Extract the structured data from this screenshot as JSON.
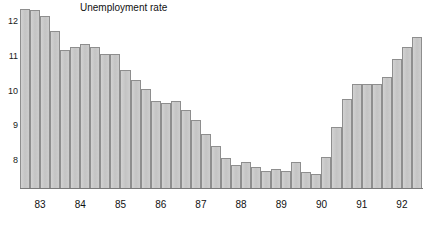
{
  "chart_data": {
    "type": "bar",
    "title": "Unemployment rate",
    "xlabel": "",
    "ylabel": "",
    "ylim": [
      7.2,
      12.6
    ],
    "yticks": [
      8,
      9,
      10,
      11,
      12
    ],
    "ytick_labels": [
      "8",
      "9",
      "10",
      "11",
      "12"
    ],
    "grid": false,
    "legend": "none",
    "categories": [
      "83 Q1",
      "83 Q2",
      "83 Q3",
      "83 Q4",
      "84 Q1",
      "84 Q2",
      "84 Q3",
      "84 Q4",
      "85 Q1",
      "85 Q2",
      "85 Q3",
      "85 Q4",
      "86 Q1",
      "86 Q2",
      "86 Q3",
      "86 Q4",
      "87 Q1",
      "87 Q2",
      "87 Q3",
      "87 Q4",
      "88 Q1",
      "88 Q2",
      "88 Q3",
      "88 Q4",
      "89 Q1",
      "89 Q2",
      "89 Q3",
      "89 Q4",
      "90 Q1",
      "90 Q2",
      "90 Q3",
      "90 Q4",
      "91 Q1",
      "91 Q2",
      "91 Q3",
      "91 Q4",
      "92 Q1",
      "92 Q2",
      "92 Q3",
      "92 Q4"
    ],
    "values": [
      12.35,
      12.3,
      12.15,
      11.7,
      11.15,
      11.25,
      11.35,
      11.25,
      11.05,
      11.05,
      10.6,
      10.3,
      10.05,
      9.7,
      9.65,
      9.7,
      9.45,
      9.15,
      8.75,
      8.4,
      8.05,
      7.85,
      7.95,
      7.8,
      7.7,
      7.75,
      7.7,
      7.95,
      7.65,
      7.6,
      8.1,
      8.95,
      9.75,
      10.2,
      10.2,
      10.2,
      10.4,
      10.9,
      11.25,
      11.55
    ],
    "group_labels": [
      "83",
      "84",
      "85",
      "86",
      "87",
      "88",
      "89",
      "90",
      "91",
      "92"
    ]
  },
  "style": {
    "bar_fill": "#c9c9c9",
    "bar_stroke": "#8e8e8e",
    "axis_color": "#7a7a7a",
    "text_color": "#111111",
    "background": "#ffffff"
  }
}
